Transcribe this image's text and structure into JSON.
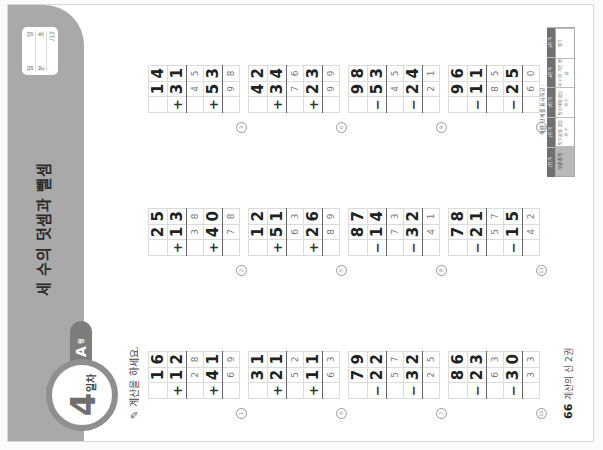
{
  "header": {
    "title": "세 수의 덧셈과 뺄셈",
    "day_number": "4",
    "day_unit": "일차",
    "level": "A",
    "level_unit": "형",
    "score_box": {
      "date_labels": [
        "월",
        "일"
      ],
      "score_labels": [
        "분",
        "초"
      ],
      "correct_label": "/12"
    }
  },
  "instruction": "계산을 하세요.",
  "problems": [
    {
      "num": "1",
      "a": [
        "1",
        "6"
      ],
      "op1": "+",
      "b": [
        "1",
        "2"
      ],
      "mid": [
        "2",
        "8"
      ],
      "op2": "+",
      "c": [
        "4",
        "1"
      ],
      "ans": [
        "6",
        "9"
      ]
    },
    {
      "num": "2",
      "a": [
        "2",
        "5"
      ],
      "op1": "+",
      "b": [
        "1",
        "3"
      ],
      "mid": [
        "3",
        "8"
      ],
      "op2": "+",
      "c": [
        "4",
        "0"
      ],
      "ans": [
        "7",
        "8"
      ]
    },
    {
      "num": "3",
      "a": [
        "1",
        "4"
      ],
      "op1": "+",
      "b": [
        "3",
        "1"
      ],
      "mid": [
        "4",
        "5"
      ],
      "op2": "+",
      "c": [
        "5",
        "3"
      ],
      "ans": [
        "9",
        "8"
      ]
    },
    {
      "num": "4",
      "a": [
        "3",
        "1"
      ],
      "op1": "+",
      "b": [
        "2",
        "1"
      ],
      "mid": [
        "5",
        "2"
      ],
      "op2": "+",
      "c": [
        "1",
        "1"
      ],
      "ans": [
        "6",
        "3"
      ]
    },
    {
      "num": "5",
      "a": [
        "1",
        "2"
      ],
      "op1": "+",
      "b": [
        "5",
        "1"
      ],
      "mid": [
        "6",
        "3"
      ],
      "op2": "+",
      "c": [
        "2",
        "6"
      ],
      "ans": [
        "8",
        "9"
      ]
    },
    {
      "num": "6",
      "a": [
        "4",
        "2"
      ],
      "op1": "+",
      "b": [
        "3",
        "4"
      ],
      "mid": [
        "7",
        "6"
      ],
      "op2": "+",
      "c": [
        "2",
        "3"
      ],
      "ans": [
        "9",
        "9"
      ]
    },
    {
      "num": "7",
      "a": [
        "7",
        "9"
      ],
      "op1": "−",
      "b": [
        "2",
        "2"
      ],
      "mid": [
        "5",
        "7"
      ],
      "op2": "−",
      "c": [
        "3",
        "2"
      ],
      "ans": [
        "2",
        "5"
      ]
    },
    {
      "num": "8",
      "a": [
        "8",
        "7"
      ],
      "op1": "−",
      "b": [
        "1",
        "4"
      ],
      "mid": [
        "7",
        "3"
      ],
      "op2": "−",
      "c": [
        "3",
        "2"
      ],
      "ans": [
        "4",
        "1"
      ]
    },
    {
      "num": "9",
      "a": [
        "9",
        "8"
      ],
      "op1": "−",
      "b": [
        "5",
        "3"
      ],
      "mid": [
        "4",
        "5"
      ],
      "op2": "−",
      "c": [
        "2",
        "4"
      ],
      "ans": [
        "2",
        "1"
      ]
    },
    {
      "num": "10",
      "a": [
        "8",
        "6"
      ],
      "op1": "−",
      "b": [
        "2",
        "3"
      ],
      "mid": [
        "6",
        "3"
      ],
      "op2": "−",
      "c": [
        "3",
        "0"
      ],
      "ans": [
        "3",
        "3"
      ]
    },
    {
      "num": "11",
      "a": [
        "7",
        "8"
      ],
      "op1": "−",
      "b": [
        "2",
        "1"
      ],
      "mid": [
        "5",
        "7"
      ],
      "op2": "−",
      "c": [
        "1",
        "5"
      ],
      "ans": [
        "4",
        "2"
      ]
    },
    {
      "num": "12",
      "a": [
        "9",
        "6"
      ],
      "op1": "−",
      "b": [
        "1",
        "1"
      ],
      "mid": [
        "8",
        "5"
      ],
      "op2": "−",
      "c": [
        "2",
        "5"
      ],
      "ans": [
        "6",
        "0"
      ]
    }
  ],
  "footer": {
    "page_number": "66",
    "book_title": "계산의 신 2권",
    "progress_caption": "학습 단계를 표시해요.",
    "progress_headers": [
      "1단계",
      "2단계",
      "3단계",
      "4단계",
      "5단계"
    ],
    "progress_steps": [
      "개념 잡기",
      "받아올림 없는 세 수",
      "받아내림 없는 세 수",
      "세 수의 계산 연습",
      "평가"
    ],
    "active_step": 0
  },
  "colors": {
    "header_bg": "#a9a9a9",
    "badge_ring": "#8f8f8f",
    "level_tab": "#7d7d7d"
  }
}
